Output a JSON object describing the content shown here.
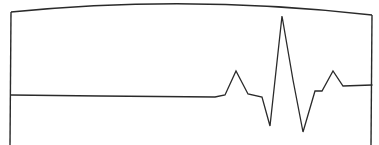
{
  "diagram": {
    "type": "line-drawing",
    "stroke_color": "#2a2a2a",
    "background_color": "#ffffff",
    "frame": {
      "left_edge": {
        "x": 11,
        "y_top": 12,
        "y_bottom": 145
      },
      "right_edge": {
        "x": 372,
        "y_top": 15,
        "y_bottom": 145
      },
      "top_curve": {
        "start": [
          11,
          12
        ],
        "control": [
          190,
          -6
        ],
        "end": [
          372,
          15
        ]
      }
    },
    "waveform": {
      "baseline_y": 95,
      "points": [
        [
          11,
          95
        ],
        [
          100,
          96
        ],
        [
          215,
          97
        ],
        [
          225,
          95
        ],
        [
          236,
          71
        ],
        [
          248,
          94
        ],
        [
          262,
          97
        ],
        [
          270,
          126
        ],
        [
          282,
          16
        ],
        [
          293,
          80
        ],
        [
          303,
          132
        ],
        [
          315,
          91
        ],
        [
          322,
          91
        ],
        [
          333,
          71
        ],
        [
          343,
          86
        ],
        [
          372,
          85
        ]
      ]
    }
  }
}
